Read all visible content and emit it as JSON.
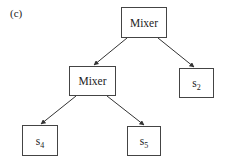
{
  "panel_label": "(c)",
  "nodes": {
    "root": {
      "label": "Mixer"
    },
    "mixer2": {
      "label": "Mixer"
    },
    "s2": {
      "base": "s",
      "sub": "2"
    },
    "s4": {
      "base": "s",
      "sub": "4"
    },
    "s5": {
      "base": "s",
      "sub": "5"
    }
  },
  "edges": [
    {
      "from": "root",
      "to": "mixer2"
    },
    {
      "from": "root",
      "to": "s2"
    },
    {
      "from": "mixer2",
      "to": "s4"
    },
    {
      "from": "mixer2",
      "to": "s5"
    }
  ]
}
